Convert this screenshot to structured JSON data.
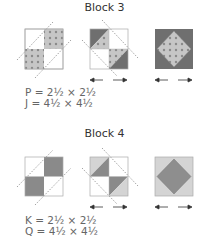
{
  "blocks": [
    {
      "title": "Block 3",
      "dims": [
        "P = 2½ × 2½",
        "J = 4½ × 4½"
      ],
      "colors": {
        "light": "#c9c9c9",
        "dark": "#7a7a7a",
        "dot": "#999999",
        "line": "#9a9a9a"
      }
    },
    {
      "title": "Block 4",
      "dims": [
        "K = 2½ × 2½",
        "Q = 4½ × 4½"
      ],
      "colors": {
        "light": "#d6d6d6",
        "dark": "#8e8e8e",
        "line": "#9a9a9a"
      }
    }
  ],
  "icons": [
    "pressing-arrow-left-icon",
    "pressing-arrow-right-icon"
  ]
}
